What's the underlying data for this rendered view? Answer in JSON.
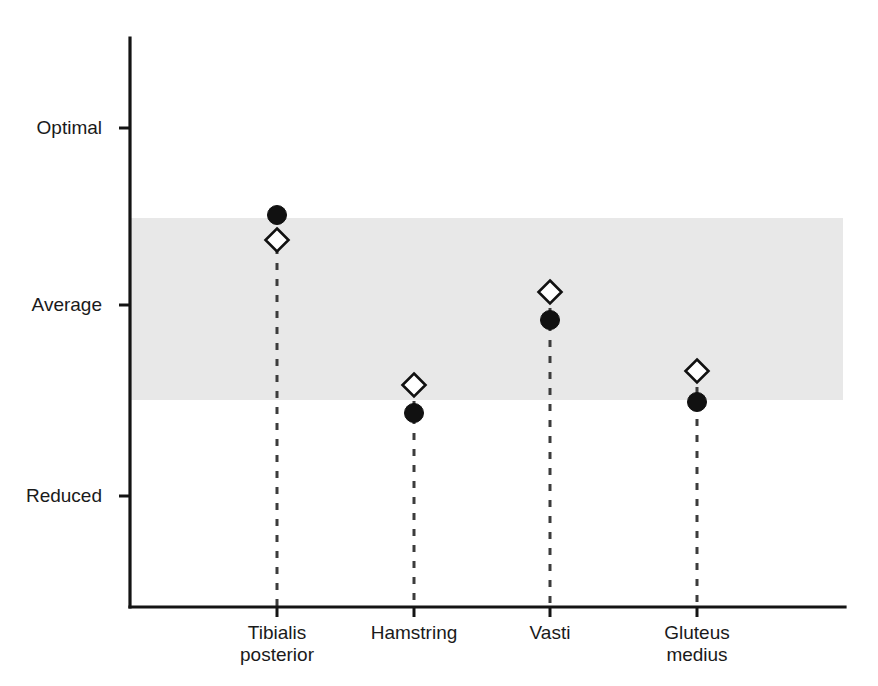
{
  "chart_data": {
    "type": "scatter",
    "title": "",
    "subtitle": "",
    "xlabel": "",
    "ylabel": "",
    "grid": false,
    "legend_position": "none",
    "categories": [
      "Tibialis posterior",
      "Hamstring",
      "Vasti",
      "Gluteus medius"
    ],
    "category_lines": [
      [
        "Tibialis",
        "posterior"
      ],
      [
        "Hamstring"
      ],
      [
        "Vasti"
      ],
      [
        "Gluteus",
        "medius"
      ]
    ],
    "y_axis": {
      "tick_labels": [
        "Optimal",
        "Average",
        "Reduced"
      ],
      "tick_values": [
        3,
        2,
        1
      ],
      "ylim": [
        0.45,
        3.45
      ],
      "direction": "increasing-upward"
    },
    "shaded_band": {
      "label": "Average range",
      "y_from": 1.45,
      "y_to": 2.47,
      "color": "#e8e8e8"
    },
    "series": [
      {
        "name": "Filled circle",
        "marker": "filled-circle",
        "color": "#111111",
        "values": [
          2.48,
          1.4,
          2.1,
          1.46
        ]
      },
      {
        "name": "Open diamond",
        "marker": "open-diamond",
        "color": "#ffffff",
        "edge_color": "#111111",
        "values": [
          2.35,
          1.55,
          2.26,
          1.62
        ]
      }
    ],
    "stems": {
      "style": "dashed",
      "from": "marker",
      "to": "x-axis",
      "color": "#3c3c3c"
    },
    "geometry": {
      "plot_left": 130,
      "plot_right": 845,
      "plot_top": 38,
      "plot_bottom": 607,
      "band_top_px": 218,
      "band_bottom_px": 400,
      "band_right_px": 843,
      "y_tick_px": [
        128,
        305,
        496
      ],
      "x_tick_px": [
        277,
        414,
        550,
        697
      ],
      "circle_y_px": [
        215,
        413,
        320,
        402
      ],
      "diamond_y_px": [
        240,
        385,
        292,
        371
      ],
      "circle_radius_px": 9.5,
      "diamond_half_px": 11.5
    },
    "colors": {
      "axis": "#141414",
      "band": "#e8e8e8",
      "marker_fill": "#111111",
      "marker_edge": "#111111",
      "stem": "#3c3c3c",
      "background": "#ffffff"
    }
  }
}
